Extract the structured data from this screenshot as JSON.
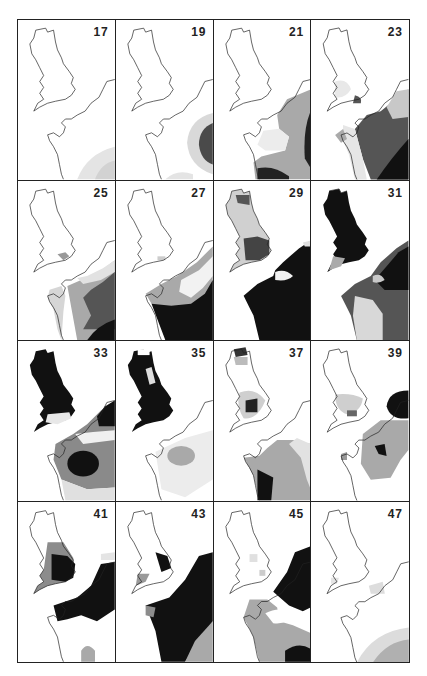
{
  "figure": {
    "layout": {
      "rows": 4,
      "columns": 4
    },
    "shading_levels": {
      "none": "#ffffff",
      "light": "#e4e4e4",
      "medium": "#a9a9a9",
      "dark": "#595959",
      "darkest": "#111111"
    },
    "panels": [
      {
        "label": "17"
      },
      {
        "label": "19"
      },
      {
        "label": "21"
      },
      {
        "label": "23"
      },
      {
        "label": "25"
      },
      {
        "label": "27"
      },
      {
        "label": "29"
      },
      {
        "label": "31"
      },
      {
        "label": "33"
      },
      {
        "label": "35"
      },
      {
        "label": "37"
      },
      {
        "label": "39"
      },
      {
        "label": "41"
      },
      {
        "label": "43"
      },
      {
        "label": "45"
      },
      {
        "label": "47"
      }
    ]
  }
}
